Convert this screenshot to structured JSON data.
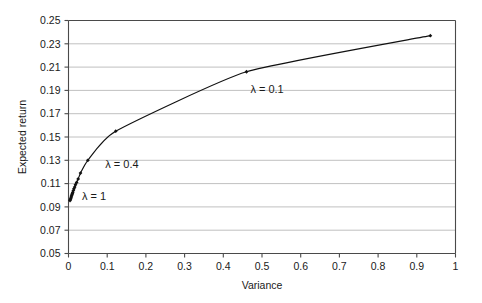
{
  "chart_data": {
    "type": "line",
    "title": "",
    "xlabel": "Variance",
    "ylabel": "Expected return",
    "xlim": [
      0,
      1
    ],
    "ylim": [
      0.05,
      0.25
    ],
    "xticks": [
      "0",
      "0.1",
      "0.2",
      "0.3",
      "0.4",
      "0.5",
      "0.6",
      "0.7",
      "0.8",
      "0.9",
      "1"
    ],
    "xtick_values": [
      0,
      0.1,
      0.2,
      0.3,
      0.4,
      0.5,
      0.6,
      0.7,
      0.8,
      0.9,
      1
    ],
    "yticks": [
      "0.05",
      "0.07",
      "0.09",
      "0.11",
      "0.13",
      "0.15",
      "0.17",
      "0.19",
      "0.21",
      "0.23",
      "0.25"
    ],
    "ytick_values": [
      0.05,
      0.07,
      0.09,
      0.11,
      0.13,
      0.15,
      0.17,
      0.19,
      0.21,
      0.23,
      0.25
    ],
    "grid": "horizontal",
    "legend": "none",
    "marker": "filled-diamond",
    "line_color": "#111111",
    "grid_color": "#b0b0b0",
    "axis_color": "#4a4a4a",
    "series": [
      {
        "name": "Efficient frontier",
        "x": [
          0.004,
          0.005,
          0.006,
          0.007,
          0.008,
          0.009,
          0.01,
          0.011,
          0.0125,
          0.014,
          0.016,
          0.018,
          0.021,
          0.025,
          0.031,
          0.05,
          0.122,
          0.46,
          0.935
        ],
        "y": [
          0.0955,
          0.0965,
          0.0975,
          0.0985,
          0.0995,
          0.1005,
          0.1015,
          0.1025,
          0.104,
          0.1055,
          0.107,
          0.109,
          0.111,
          0.114,
          0.119,
          0.13,
          0.155,
          0.206,
          0.237
        ]
      }
    ],
    "annotations": [
      {
        "text": "λ  = 0.1",
        "x": 0.47,
        "y": 0.188
      },
      {
        "text": "λ  = 0.4",
        "x": 0.095,
        "y": 0.123
      },
      {
        "text": "λ  = 1",
        "x": 0.035,
        "y": 0.0955
      }
    ]
  }
}
